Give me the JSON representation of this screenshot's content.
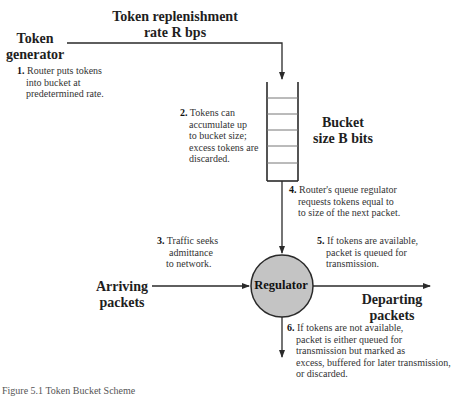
{
  "labels": {
    "token_generator": [
      "Token",
      "generator"
    ],
    "replenishment_rate": [
      "Token replenishment",
      "rate R bps"
    ],
    "bucket_size": [
      "Bucket",
      "size B bits"
    ],
    "arriving_packets": [
      "Arriving",
      "packets"
    ],
    "departing_packets": [
      "Departing",
      "packets"
    ],
    "regulator": "Regulator"
  },
  "notes": [
    {
      "num": "1.",
      "lines": [
        "Router puts tokens",
        "into bucket at",
        "predetermined rate."
      ]
    },
    {
      "num": "2.",
      "lines": [
        "Tokens can",
        "accumulate up",
        "to bucket size;",
        "excess tokens are",
        "discarded."
      ]
    },
    {
      "num": "3.",
      "lines": [
        "Traffic seeks",
        "admittance",
        "to network."
      ]
    },
    {
      "num": "4.",
      "lines": [
        "Router's queue regulator",
        "requests tokens equal to",
        "to size of the next packet."
      ]
    },
    {
      "num": "5.",
      "lines": [
        "If tokens are available,",
        "packet is queued for",
        "transmission."
      ]
    },
    {
      "num": "6.",
      "lines": [
        "If tokens are not available,",
        "packet is either queued for",
        "transmission but marked as",
        "excess, buffered for later transmission,",
        "or discarded."
      ]
    }
  ],
  "caption": "Figure 5.1  Token Bucket Scheme",
  "colors": {
    "regulator_fill": "#c4c4c4",
    "line": "#2a2a2a"
  }
}
